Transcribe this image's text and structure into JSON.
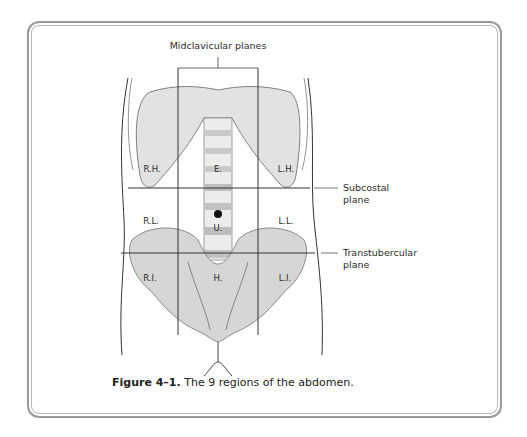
{
  "figure": {
    "callouts": {
      "midclavicular": "Midclavicular planes",
      "subcostal_line1": "Subcostal",
      "subcostal_line2": "plane",
      "transtubercular_line1": "Transtubercular",
      "transtubercular_line2": "plane"
    },
    "regions": {
      "right_hypochondriac": "R.H.",
      "epigastric": "E.",
      "left_hypochondriac": "L.H.",
      "right_lumbar": "R.L.",
      "umbilical": "U.",
      "left_lumbar": "L.L.",
      "right_iliac": "R.I.",
      "hypogastric": "H.",
      "left_iliac": "L.I."
    },
    "caption": {
      "number": "Figure 4–1.",
      "text": "The 9 regions of the abdomen."
    },
    "colors": {
      "frame": "#9a9a9a",
      "bone_fill": "#dcdcdc",
      "bone_stroke": "#7a7a7a",
      "plane_lines": "#333333"
    }
  }
}
